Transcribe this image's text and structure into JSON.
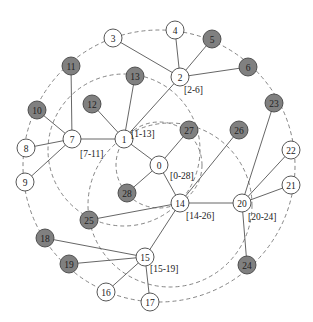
{
  "colors": {
    "background": "#ffffff",
    "edge": "#555555",
    "dashed": "#777777",
    "node_white_fill": "#ffffff",
    "node_gray_fill": "#808080",
    "node_stroke": "#444444",
    "text": "#222222"
  },
  "nodes": [
    {
      "id": "0",
      "x": 159,
      "y": 165,
      "filled": false
    },
    {
      "id": "1",
      "x": 124,
      "y": 139,
      "filled": false
    },
    {
      "id": "2",
      "x": 180,
      "y": 77,
      "filled": false
    },
    {
      "id": "3",
      "x": 113,
      "y": 38,
      "filled": false
    },
    {
      "id": "4",
      "x": 175,
      "y": 30,
      "filled": false
    },
    {
      "id": "5",
      "x": 212,
      "y": 39,
      "filled": true
    },
    {
      "id": "6",
      "x": 248,
      "y": 67,
      "filled": true
    },
    {
      "id": "7",
      "x": 72,
      "y": 139,
      "filled": false
    },
    {
      "id": "8",
      "x": 26,
      "y": 148,
      "filled": false
    },
    {
      "id": "9",
      "x": 25,
      "y": 182,
      "filled": false
    },
    {
      "id": "10",
      "x": 37,
      "y": 110,
      "filled": true
    },
    {
      "id": "11",
      "x": 71,
      "y": 66,
      "filled": true
    },
    {
      "id": "12",
      "x": 92,
      "y": 104,
      "filled": true
    },
    {
      "id": "13",
      "x": 135,
      "y": 76,
      "filled": true
    },
    {
      "id": "14",
      "x": 180,
      "y": 203,
      "filled": false
    },
    {
      "id": "15",
      "x": 145,
      "y": 257,
      "filled": false
    },
    {
      "id": "16",
      "x": 106,
      "y": 292,
      "filled": false
    },
    {
      "id": "17",
      "x": 150,
      "y": 302,
      "filled": false
    },
    {
      "id": "18",
      "x": 45,
      "y": 238,
      "filled": true
    },
    {
      "id": "19",
      "x": 69,
      "y": 264,
      "filled": true
    },
    {
      "id": "20",
      "x": 242,
      "y": 203,
      "filled": false
    },
    {
      "id": "21",
      "x": 291,
      "y": 185,
      "filled": false
    },
    {
      "id": "22",
      "x": 291,
      "y": 150,
      "filled": false
    },
    {
      "id": "23",
      "x": 274,
      "y": 103,
      "filled": true
    },
    {
      "id": "24",
      "x": 247,
      "y": 265,
      "filled": true
    },
    {
      "id": "25",
      "x": 89,
      "y": 220,
      "filled": true
    },
    {
      "id": "26",
      "x": 239,
      "y": 130,
      "filled": true
    },
    {
      "id": "27",
      "x": 189,
      "y": 130,
      "filled": true
    },
    {
      "id": "28",
      "x": 127,
      "y": 193,
      "filled": true
    }
  ],
  "edges": [
    [
      "0",
      "1"
    ],
    [
      "0",
      "27"
    ],
    [
      "0",
      "28"
    ],
    [
      "0",
      "14"
    ],
    [
      "1",
      "2"
    ],
    [
      "1",
      "7"
    ],
    [
      "1",
      "12"
    ],
    [
      "1",
      "13"
    ],
    [
      "2",
      "3"
    ],
    [
      "2",
      "4"
    ],
    [
      "2",
      "5"
    ],
    [
      "2",
      "6"
    ],
    [
      "7",
      "8"
    ],
    [
      "7",
      "9"
    ],
    [
      "7",
      "10"
    ],
    [
      "7",
      "11"
    ],
    [
      "14",
      "20"
    ],
    [
      "14",
      "25"
    ],
    [
      "14",
      "26"
    ],
    [
      "14",
      "15"
    ],
    [
      "15",
      "16"
    ],
    [
      "15",
      "17"
    ],
    [
      "15",
      "18"
    ],
    [
      "15",
      "19"
    ],
    [
      "20",
      "21"
    ],
    [
      "20",
      "22"
    ],
    [
      "20",
      "23"
    ],
    [
      "20",
      "24"
    ]
  ],
  "dashed_circles": [
    {
      "name": "outer-ring",
      "cx": 159,
      "cy": 166,
      "r": 136
    },
    {
      "name": "ring-1-13",
      "cx": 124,
      "cy": 150,
      "r": 76
    },
    {
      "name": "ring-0-28",
      "cx": 159,
      "cy": 165,
      "r": 43
    },
    {
      "name": "ring-14-26",
      "cx": 170,
      "cy": 205,
      "r": 82
    }
  ],
  "range_labels": [
    {
      "text": "[1-13]",
      "x": 131,
      "y": 137
    },
    {
      "text": "[2-6]",
      "x": 184,
      "y": 93
    },
    {
      "text": "[7-11]",
      "x": 80,
      "y": 157
    },
    {
      "text": "[0-28]",
      "x": 170,
      "y": 179
    },
    {
      "text": "[14-26]",
      "x": 186,
      "y": 219
    },
    {
      "text": "[20-24]",
      "x": 248,
      "y": 220
    },
    {
      "text": "[15-19]",
      "x": 150,
      "y": 272
    }
  ],
  "node_radius": 9
}
